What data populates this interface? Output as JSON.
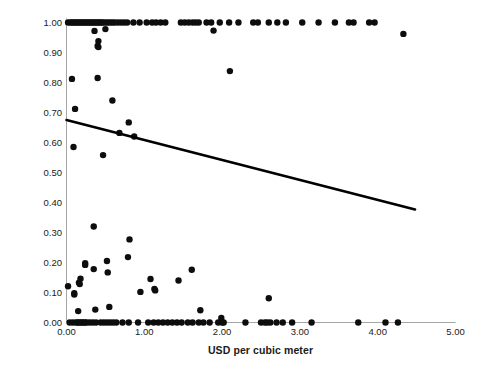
{
  "chart_data": {
    "type": "scatter",
    "title": "",
    "xlabel": "USD per cubic meter",
    "ylabel": "Risk of water shortage",
    "xlim": [
      0.0,
      5.0
    ],
    "ylim": [
      0.0,
      1.0
    ],
    "xticks": [
      "0.00",
      "1.00",
      "2.00",
      "3.00",
      "4.00",
      "5.00"
    ],
    "xtick_values": [
      0.0,
      1.0,
      2.0,
      3.0,
      4.0,
      5.0
    ],
    "yticks": [
      "0.00",
      "0.10",
      "0.20",
      "0.30",
      "0.40",
      "0.50",
      "0.60",
      "0.70",
      "0.80",
      "0.90",
      "1.00"
    ],
    "ytick_values": [
      0.0,
      0.1,
      0.2,
      0.3,
      0.4,
      0.5,
      0.6,
      0.7,
      0.8,
      0.9,
      1.0
    ],
    "grid": false,
    "legend": "none",
    "marker": {
      "shape": "circle",
      "color": "#0d0d0d",
      "size": 4.2
    },
    "trendline": {
      "type": "linear",
      "color": "#000000",
      "width": 2.6,
      "x_start": 0.0,
      "y_start": 0.675,
      "x_end": 4.48,
      "y_end": 0.377,
      "slope": -0.0665,
      "intercept": 0.675
    },
    "series": [
      {
        "name": "Water utilities",
        "points": [
          [
            0.02,
            1.0
          ],
          [
            0.05,
            1.0
          ],
          [
            0.07,
            1.0
          ],
          [
            0.09,
            1.0
          ],
          [
            0.11,
            1.0
          ],
          [
            0.13,
            1.0
          ],
          [
            0.15,
            1.0
          ],
          [
            0.17,
            1.0
          ],
          [
            0.19,
            1.0
          ],
          [
            0.21,
            1.0
          ],
          [
            0.23,
            1.0
          ],
          [
            0.25,
            1.0
          ],
          [
            0.27,
            1.0
          ],
          [
            0.29,
            1.0
          ],
          [
            0.31,
            1.0
          ],
          [
            0.33,
            1.0
          ],
          [
            0.35,
            1.0
          ],
          [
            0.37,
            1.0
          ],
          [
            0.39,
            1.0
          ],
          [
            0.41,
            1.0
          ],
          [
            0.43,
            1.0
          ],
          [
            0.45,
            1.0
          ],
          [
            0.47,
            1.0
          ],
          [
            0.5,
            1.0
          ],
          [
            0.53,
            1.0
          ],
          [
            0.56,
            1.0
          ],
          [
            0.59,
            1.0
          ],
          [
            0.62,
            1.0
          ],
          [
            0.66,
            1.0
          ],
          [
            0.7,
            1.0
          ],
          [
            0.74,
            1.0
          ],
          [
            0.78,
            1.0
          ],
          [
            0.86,
            1.0
          ],
          [
            0.94,
            1.0
          ],
          [
            1.03,
            1.0
          ],
          [
            1.1,
            1.0
          ],
          [
            1.15,
            1.0
          ],
          [
            1.21,
            1.0
          ],
          [
            1.27,
            1.0
          ],
          [
            1.47,
            1.0
          ],
          [
            1.52,
            1.0
          ],
          [
            1.57,
            1.0
          ],
          [
            1.62,
            1.0
          ],
          [
            1.66,
            1.0
          ],
          [
            1.7,
            1.0
          ],
          [
            1.8,
            1.0
          ],
          [
            1.86,
            1.0
          ],
          [
            1.97,
            1.0
          ],
          [
            2.09,
            1.0
          ],
          [
            2.21,
            1.0
          ],
          [
            2.4,
            1.0
          ],
          [
            2.46,
            1.0
          ],
          [
            2.6,
            1.0
          ],
          [
            2.71,
            1.0
          ],
          [
            2.82,
            1.0
          ],
          [
            3.03,
            1.0
          ],
          [
            3.24,
            1.0
          ],
          [
            3.45,
            1.0
          ],
          [
            3.63,
            1.0
          ],
          [
            3.69,
            1.0
          ],
          [
            3.89,
            1.0
          ],
          [
            3.96,
            1.0
          ],
          [
            4.33,
            0.962
          ],
          [
            0.36,
            0.972
          ],
          [
            0.5,
            0.978
          ],
          [
            1.89,
            0.973
          ],
          [
            0.41,
            0.938
          ],
          [
            0.4,
            0.922
          ],
          [
            0.41,
            0.918
          ],
          [
            0.07,
            0.812
          ],
          [
            0.4,
            0.815
          ],
          [
            2.1,
            0.838
          ],
          [
            0.59,
            0.74
          ],
          [
            0.11,
            0.712
          ],
          [
            0.8,
            0.667
          ],
          [
            0.68,
            0.632
          ],
          [
            0.87,
            0.62
          ],
          [
            0.09,
            0.585
          ],
          [
            0.47,
            0.558
          ],
          [
            0.35,
            0.32
          ],
          [
            0.81,
            0.277
          ],
          [
            0.79,
            0.218
          ],
          [
            0.24,
            0.198
          ],
          [
            0.24,
            0.192
          ],
          [
            0.52,
            0.205
          ],
          [
            0.35,
            0.178
          ],
          [
            1.61,
            0.176
          ],
          [
            0.53,
            0.167
          ],
          [
            0.18,
            0.146
          ],
          [
            1.08,
            0.145
          ],
          [
            1.44,
            0.14
          ],
          [
            0.16,
            0.133
          ],
          [
            0.17,
            0.128
          ],
          [
            0.02,
            0.121
          ],
          [
            1.13,
            0.112
          ],
          [
            1.14,
            0.107
          ],
          [
            0.95,
            0.102
          ],
          [
            0.1,
            0.098
          ],
          [
            0.1,
            0.093
          ],
          [
            2.6,
            0.081
          ],
          [
            0.55,
            0.052
          ],
          [
            0.37,
            0.043
          ],
          [
            1.72,
            0.041
          ],
          [
            0.15,
            0.038
          ],
          [
            1.99,
            0.015
          ],
          [
            0.04,
            0.0
          ],
          [
            0.08,
            0.0
          ],
          [
            0.12,
            0.0
          ],
          [
            0.14,
            0.0
          ],
          [
            0.16,
            0.0
          ],
          [
            0.18,
            0.0
          ],
          [
            0.2,
            0.0
          ],
          [
            0.22,
            0.0
          ],
          [
            0.24,
            0.0
          ],
          [
            0.26,
            0.0
          ],
          [
            0.3,
            0.0
          ],
          [
            0.34,
            0.0
          ],
          [
            0.38,
            0.0
          ],
          [
            0.44,
            0.0
          ],
          [
            0.48,
            0.0
          ],
          [
            0.52,
            0.0
          ],
          [
            0.56,
            0.0
          ],
          [
            0.6,
            0.0
          ],
          [
            0.64,
            0.0
          ],
          [
            0.72,
            0.0
          ],
          [
            0.8,
            0.0
          ],
          [
            0.92,
            0.0
          ],
          [
            1.05,
            0.0
          ],
          [
            1.12,
            0.0
          ],
          [
            1.18,
            0.0
          ],
          [
            1.24,
            0.0
          ],
          [
            1.3,
            0.0
          ],
          [
            1.36,
            0.0
          ],
          [
            1.42,
            0.0
          ],
          [
            1.48,
            0.0
          ],
          [
            1.56,
            0.0
          ],
          [
            1.62,
            0.0
          ],
          [
            1.7,
            0.0
          ],
          [
            1.76,
            0.0
          ],
          [
            1.84,
            0.0
          ],
          [
            1.95,
            0.0
          ],
          [
            2.0,
            0.0
          ],
          [
            2.02,
            0.0
          ],
          [
            2.3,
            0.0
          ],
          [
            2.5,
            0.0
          ],
          [
            2.55,
            0.0
          ],
          [
            2.58,
            0.0
          ],
          [
            2.62,
            0.0
          ],
          [
            2.7,
            0.0
          ],
          [
            2.78,
            0.0
          ],
          [
            2.9,
            0.0
          ],
          [
            3.15,
            0.0
          ],
          [
            3.75,
            0.0
          ],
          [
            4.1,
            0.0
          ],
          [
            4.26,
            0.0
          ]
        ]
      }
    ]
  },
  "axis": {
    "y_title": "Risk of water shortage",
    "x_title": "USD per cubic meter"
  }
}
